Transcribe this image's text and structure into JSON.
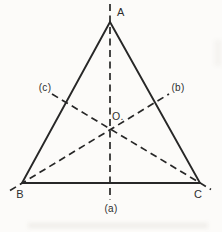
{
  "figure": {
    "vertices": [
      {
        "label": "A"
      },
      {
        "label": "B"
      },
      {
        "label": "C"
      }
    ],
    "center_label": "O.",
    "axes": [
      {
        "label": "(a)"
      },
      {
        "label": "(b)"
      },
      {
        "label": "(c)"
      }
    ],
    "colors": {
      "background": "#fcfbf9",
      "line": "#272727",
      "text": "#2e2e2e"
    }
  }
}
